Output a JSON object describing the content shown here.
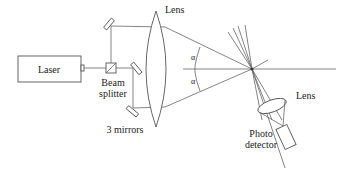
{
  "diagram": {
    "labels": {
      "laser": "Laser",
      "beam_splitter_line1": "Beam",
      "beam_splitter_line2": "splitter",
      "mirrors": "3 mirrors",
      "lens_main": "Lens",
      "lens_detector": "Lens",
      "detector_line1": "Photo",
      "detector_line2": "detector",
      "angle_upper": "α",
      "angle_lower": "α"
    },
    "colors": {
      "line": "#666666",
      "text": "#222222",
      "background": "#ffffff"
    }
  }
}
